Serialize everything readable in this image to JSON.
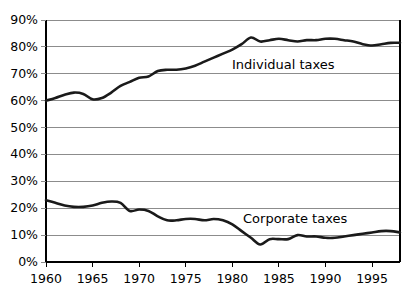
{
  "chart_data": {
    "type": "line",
    "title": "",
    "subtitle": "",
    "xlabel": "",
    "ylabel": "",
    "xlim": [
      1960,
      1998
    ],
    "ylim": [
      0,
      90
    ],
    "grid": true,
    "grid_axis": "y",
    "legend_position": "inline-annotation",
    "y_tick_labels": [
      "90%",
      "80%",
      "70%",
      "60%",
      "50%",
      "40%",
      "30%",
      "20%",
      "10%",
      "0%"
    ],
    "y_tick_values": [
      90,
      80,
      70,
      60,
      50,
      40,
      30,
      20,
      10,
      0
    ],
    "x_tick_labels": [
      "1960",
      "1965",
      "1970",
      "1975",
      "1980",
      "1985",
      "1990",
      "1995"
    ],
    "x_tick_values": [
      1960,
      1965,
      1970,
      1975,
      1980,
      1985,
      1990,
      1995
    ],
    "x": [
      1960,
      1961,
      1962,
      1963,
      1964,
      1965,
      1966,
      1967,
      1968,
      1969,
      1970,
      1971,
      1972,
      1973,
      1974,
      1975,
      1976,
      1977,
      1978,
      1979,
      1980,
      1981,
      1982,
      1983,
      1984,
      1985,
      1986,
      1987,
      1988,
      1989,
      1990,
      1991,
      1992,
      1993,
      1994,
      1995,
      1996,
      1997,
      1998
    ],
    "series": [
      {
        "name": "Individual taxes",
        "color": "#1a1a1a",
        "values": [
          60.0,
          61.0,
          62.2,
          63.0,
          62.5,
          60.5,
          61.0,
          63.0,
          65.5,
          67.0,
          68.5,
          69.0,
          71.0,
          71.5,
          71.5,
          72.0,
          73.0,
          74.5,
          76.0,
          77.5,
          79.0,
          81.0,
          83.5,
          82.0,
          82.5,
          83.0,
          82.5,
          82.0,
          82.5,
          82.5,
          83.0,
          83.0,
          82.5,
          82.0,
          81.0,
          80.5,
          81.0,
          81.5,
          81.5
        ]
      },
      {
        "name": "Corporate taxes",
        "color": "#1a1a1a",
        "values": [
          23.0,
          22.0,
          21.0,
          20.5,
          20.5,
          21.0,
          22.0,
          22.5,
          22.0,
          19.0,
          19.5,
          19.0,
          17.0,
          15.5,
          15.5,
          16.0,
          16.0,
          15.5,
          16.0,
          15.5,
          14.0,
          11.5,
          9.0,
          6.5,
          8.5,
          8.5,
          8.5,
          10.0,
          9.5,
          9.5,
          9.0,
          9.0,
          9.5,
          10.0,
          10.5,
          11.0,
          11.5,
          11.5,
          11.0
        ]
      }
    ],
    "annotations": [
      {
        "text": "Individual taxes",
        "x_px": 232,
        "y_px": 58
      },
      {
        "text": "Corporate taxes",
        "x_px": 243,
        "y_px": 212
      }
    ],
    "axis_color": "#000000",
    "grid_color": "#8c8c8c",
    "line_color": "#1a1a1a"
  }
}
